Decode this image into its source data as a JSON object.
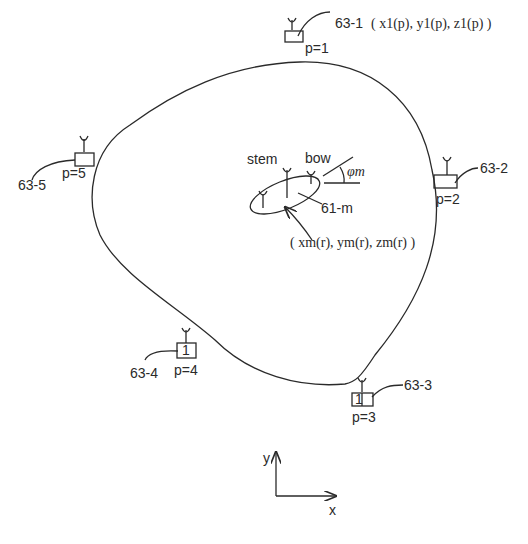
{
  "figure": {
    "colors": {
      "line": "#2a2a2a",
      "background": "#ffffff"
    }
  },
  "antennas": [
    {
      "id": "63-1",
      "label": "63-1",
      "coord_label": "( x1(p), y1(p), z1(p) )",
      "p_label": "p=1",
      "box_text": ""
    },
    {
      "id": "63-2",
      "label": "63-2",
      "p_label": "p=2",
      "box_text": ""
    },
    {
      "id": "63-3",
      "label": "63-3",
      "p_label": "p=3",
      "box_text": "1"
    },
    {
      "id": "63-4",
      "label": "63-4",
      "p_label": "p=4",
      "box_text": "1"
    },
    {
      "id": "63-5",
      "label": "63-5",
      "p_label": "p=5",
      "box_text": ""
    }
  ],
  "vessel": {
    "label": "61-m",
    "stem_label": "stem",
    "bow_label": "bow",
    "angle_label": "φm",
    "position_label": "( xm(r), ym(r), zm(r) )"
  },
  "axes": {
    "x_label": "x",
    "y_label": "y"
  }
}
